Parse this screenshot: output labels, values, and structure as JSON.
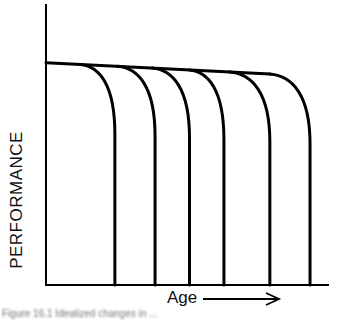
{
  "chart_data": {
    "type": "line",
    "title": "",
    "xlabel": "Age",
    "ylabel": "PERFORMANCE",
    "x_arrow": true,
    "grid": false,
    "legend": null,
    "plateau": {
      "x_start": 0.0,
      "y_start": 0.78,
      "x_end": 0.78,
      "y_end": 0.74
    },
    "series": [
      {
        "name": "curve-1",
        "dropoff_start_x": 0.12,
        "zero_at_x": 0.24
      },
      {
        "name": "curve-2",
        "dropoff_start_x": 0.25,
        "zero_at_x": 0.38
      },
      {
        "name": "curve-3",
        "dropoff_start_x": 0.37,
        "zero_at_x": 0.5
      },
      {
        "name": "curve-4",
        "dropoff_start_x": 0.5,
        "zero_at_x": 0.62
      },
      {
        "name": "curve-5",
        "dropoff_start_x": 0.64,
        "zero_at_x": 0.78
      },
      {
        "name": "curve-6",
        "dropoff_start_x": 0.78,
        "zero_at_x": 0.92
      }
    ],
    "xlim": [
      0,
      1
    ],
    "ylim": [
      0,
      1
    ]
  },
  "labels": {
    "y_axis": "PERFORMANCE",
    "x_axis": "Age",
    "caption": "Figure 16.1  Idealized changes in ..."
  },
  "colors": {
    "line": "#000000",
    "background": "#ffffff"
  }
}
